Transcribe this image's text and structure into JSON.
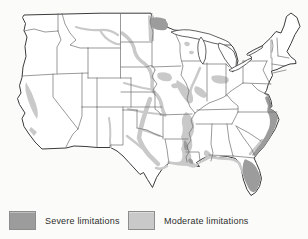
{
  "legend": {
    "items": [
      {
        "id": "severe",
        "label": "Severe limitations",
        "color": "#9c9c9c"
      },
      {
        "id": "moderate",
        "label": "Moderate limitations",
        "color": "#c9c9c9"
      }
    ]
  },
  "map": {
    "colors": {
      "background": "#fbfbf9",
      "outline": "#3b3b3b",
      "state_border": "#6e6e6e",
      "water_fill": "#ffffff"
    },
    "regions": [
      {
        "id": "california-central-valley",
        "severity": "moderate"
      },
      {
        "id": "southern-california-patch",
        "severity": "moderate"
      },
      {
        "id": "montana-missouri-river",
        "severity": "moderate"
      },
      {
        "id": "red-river-valley",
        "severity": "moderate"
      },
      {
        "id": "dakota-nebraska-missouri-river",
        "severity": "moderate"
      },
      {
        "id": "platte-river",
        "severity": "moderate"
      },
      {
        "id": "iowa-patch-west",
        "severity": "moderate"
      },
      {
        "id": "iowa-patch-east",
        "severity": "moderate"
      },
      {
        "id": "mississippi-confluence-lowland",
        "severity": "moderate"
      },
      {
        "id": "illinois-river",
        "severity": "moderate"
      },
      {
        "id": "wisconsin-patches",
        "severity": "moderate"
      },
      {
        "id": "lake-erie-west-shore",
        "severity": "moderate"
      },
      {
        "id": "central-illinois-indiana",
        "severity": "moderate"
      },
      {
        "id": "lower-mississippi-valley",
        "severity": "moderate"
      },
      {
        "id": "gulf-coast-strip",
        "severity": "moderate"
      },
      {
        "id": "mississippi-delta",
        "severity": "moderate"
      },
      {
        "id": "texas-central-band",
        "severity": "moderate"
      },
      {
        "id": "texas-brazos-branch",
        "severity": "moderate"
      },
      {
        "id": "texas-coastal",
        "severity": "moderate"
      },
      {
        "id": "red-river-texas",
        "severity": "moderate"
      },
      {
        "id": "arkansas-river",
        "severity": "moderate"
      },
      {
        "id": "rio-grande-new-mexico",
        "severity": "moderate"
      },
      {
        "id": "florida-gulf-coast",
        "severity": "moderate"
      },
      {
        "id": "carolina-inner-coastal",
        "severity": "moderate"
      },
      {
        "id": "mobile-bay",
        "severity": "moderate"
      },
      {
        "id": "northern-minnesota",
        "severity": "severe"
      },
      {
        "id": "atlantic-coastal-plain",
        "severity": "severe"
      },
      {
        "id": "southern-florida",
        "severity": "severe"
      },
      {
        "id": "lower-mississippi-spot-north",
        "severity": "severe"
      },
      {
        "id": "lower-mississippi-spot-south",
        "severity": "severe"
      }
    ]
  }
}
